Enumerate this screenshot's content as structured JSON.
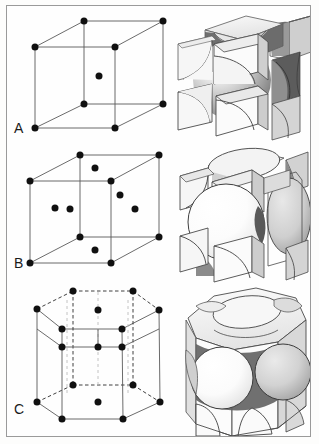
{
  "figure": {
    "background_color": "#fefefe",
    "border_color": "#9a9a9a",
    "width": 319,
    "height": 444
  },
  "panels": [
    {
      "label": "A",
      "structure_name": "body-centered cubic",
      "abbreviation": "BCC",
      "lattice_points_total": 9,
      "corner_points": 8,
      "interior_points": 1,
      "face_points": 0,
      "left_view": "lattice-point-cube",
      "right_view": "hard-sphere-model",
      "label_x": 14,
      "label_y": 133
    },
    {
      "label": "B",
      "structure_name": "face-centered cubic",
      "abbreviation": "FCC",
      "lattice_points_total": 14,
      "corner_points": 8,
      "interior_points": 0,
      "face_points": 6,
      "left_view": "lattice-point-cube",
      "right_view": "hard-sphere-model",
      "label_x": 14,
      "label_y": 268
    },
    {
      "label": "C",
      "structure_name": "hexagonal close-packed",
      "abbreviation": "HCP",
      "lattice_points_total": 17,
      "corner_points": 12,
      "interior_points": 3,
      "face_points": 2,
      "left_view": "lattice-point-hexagonal-prism",
      "right_view": "hard-sphere-model",
      "label_x": 14,
      "label_y": 414
    }
  ],
  "colors": {
    "line": "#4a4a4a",
    "dot": "#101010",
    "dashed": "#2a2a2a",
    "sphere_light": "#fbfbfb",
    "sphere_mid": "#c9c9c9",
    "sphere_dark": "#8a8a8a",
    "cube_face_light": "#f4f4f4",
    "cube_face_mid": "#d8d8d8",
    "cube_face_dark": "#a8a8a8",
    "interior_shadow": "#6e6e6e"
  },
  "geometry": {
    "panelA_cube": {
      "front_top_left": [
        35,
        47
      ],
      "front_top_right": [
        115,
        47
      ],
      "front_bottom_left": [
        35,
        128
      ],
      "front_bottom_right": [
        115,
        128
      ],
      "back_top_left": [
        84,
        21
      ],
      "back_top_right": [
        163,
        21
      ],
      "back_bottom_left": [
        84,
        104
      ],
      "back_bottom_right": [
        163,
        104
      ],
      "center": [
        99,
        76
      ]
    },
    "panelB_cube": {
      "front_top_left": [
        30,
        181
      ],
      "front_top_right": [
        111,
        181
      ],
      "front_bottom_left": [
        30,
        263
      ],
      "front_bottom_right": [
        111,
        263
      ],
      "back_top_left": [
        80,
        155
      ],
      "back_top_right": [
        159,
        155
      ],
      "back_bottom_left": [
        80,
        237
      ],
      "back_bottom_right": [
        159,
        237
      ]
    },
    "panelC_prism": {
      "top_back": [
        73,
        291
      ],
      "top_back_right": [
        133,
        291
      ],
      "top_left": [
        37,
        309
      ],
      "top_right": [
        159,
        310
      ],
      "top_front_left": [
        62,
        329
      ],
      "top_front_right": [
        122,
        329
      ],
      "bottom_back_left": [
        73,
        385
      ],
      "bottom_back_right": [
        133,
        385
      ],
      "bottom_left": [
        37,
        402
      ],
      "bottom_right": [
        160,
        402
      ],
      "bottom_front_left": [
        62,
        419
      ],
      "bottom_front_right": [
        123,
        419
      ]
    }
  }
}
